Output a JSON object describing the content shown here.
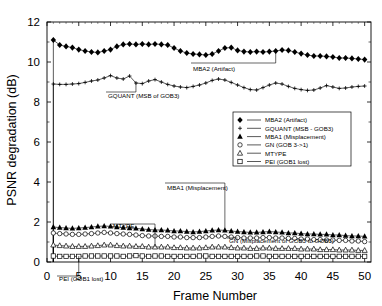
{
  "chart_data": {
    "type": "line",
    "title": "",
    "xlabel": "Frame Number",
    "ylabel": "PSNR degradation (dB)",
    "xlim": [
      0,
      51
    ],
    "ylim": [
      0,
      12
    ],
    "xticks": [
      0,
      5,
      10,
      15,
      20,
      25,
      30,
      35,
      40,
      45,
      50
    ],
    "yticks": [
      0,
      2,
      4,
      6,
      8,
      10,
      12
    ],
    "grid": false,
    "legend_position": "center-right",
    "x": [
      1,
      2,
      3,
      4,
      5,
      6,
      7,
      8,
      9,
      10,
      11,
      12,
      13,
      14,
      15,
      16,
      17,
      18,
      19,
      20,
      21,
      22,
      23,
      24,
      25,
      26,
      27,
      28,
      29,
      30,
      31,
      32,
      33,
      34,
      35,
      36,
      37,
      38,
      39,
      40,
      41,
      42,
      43,
      44,
      45,
      46,
      47,
      48,
      49,
      50
    ],
    "series": [
      {
        "name": "MBA2 (Artifact)",
        "marker": "filled-diamond",
        "color": "#000000",
        "values": [
          11.1,
          10.85,
          10.78,
          10.72,
          10.62,
          10.55,
          10.5,
          10.48,
          10.55,
          10.62,
          10.78,
          10.88,
          10.9,
          10.88,
          10.9,
          10.88,
          10.9,
          10.88,
          10.85,
          10.7,
          10.55,
          10.45,
          10.4,
          10.38,
          10.35,
          10.4,
          10.55,
          10.7,
          10.72,
          10.58,
          10.52,
          10.5,
          10.52,
          10.5,
          10.52,
          10.55,
          10.6,
          10.58,
          10.5,
          10.42,
          10.35,
          10.3,
          10.3,
          10.28,
          10.25,
          10.2,
          10.2,
          10.18,
          10.15,
          10.12
        ]
      },
      {
        "name": "GQUANT (MSB - GOB3)",
        "marker": "plus",
        "color": "#000000",
        "values": [
          8.9,
          8.88,
          8.88,
          8.9,
          8.92,
          8.98,
          9.05,
          9.1,
          9.2,
          9.32,
          9.2,
          9.15,
          9.3,
          8.95,
          8.92,
          9.05,
          9.12,
          9.0,
          8.88,
          8.8,
          8.75,
          8.72,
          8.78,
          8.85,
          8.95,
          9.08,
          9.15,
          9.1,
          8.98,
          8.85,
          8.72,
          8.62,
          8.6,
          8.72,
          8.85,
          8.95,
          8.9,
          8.78,
          8.68,
          8.62,
          8.58,
          8.6,
          8.7,
          8.82,
          8.75,
          8.68,
          8.7,
          8.75,
          8.78,
          8.8
        ]
      },
      {
        "name": "MBA1 (Misplacement)",
        "marker": "filled-triangle",
        "color": "#000000",
        "values": [
          1.75,
          1.72,
          1.7,
          1.68,
          1.7,
          1.72,
          1.75,
          1.78,
          1.8,
          1.78,
          1.75,
          1.72,
          1.7,
          1.68,
          1.65,
          1.62,
          1.6,
          1.6,
          1.58,
          1.55,
          1.55,
          1.52,
          1.5,
          1.52,
          1.55,
          1.58,
          1.6,
          1.58,
          1.55,
          1.52,
          1.5,
          1.48,
          1.48,
          1.5,
          1.52,
          1.5,
          1.48,
          1.45,
          1.45,
          1.42,
          1.4,
          1.4,
          1.38,
          1.38,
          1.35,
          1.35,
          1.32,
          1.3,
          1.3,
          1.28
        ]
      },
      {
        "name": "GN (GOB 3->1)",
        "marker": "open-circle",
        "color": "#000000",
        "values": [
          1.45,
          1.42,
          1.4,
          1.38,
          1.38,
          1.4,
          1.42,
          1.45,
          1.48,
          1.45,
          1.42,
          1.4,
          1.38,
          1.35,
          1.32,
          1.3,
          1.3,
          1.28,
          1.28,
          1.25,
          1.25,
          1.22,
          1.22,
          1.22,
          1.25,
          1.28,
          1.3,
          1.28,
          1.25,
          1.22,
          1.2,
          1.2,
          1.2,
          1.22,
          1.22,
          1.2,
          1.2,
          1.18,
          1.18,
          1.15,
          1.15,
          1.12,
          1.12,
          1.1,
          1.1,
          1.08,
          1.08,
          1.05,
          1.05,
          1.02
        ]
      },
      {
        "name": "MTYPE",
        "marker": "open-triangle",
        "color": "#000000",
        "values": [
          0.85,
          0.82,
          0.8,
          0.78,
          0.78,
          0.78,
          0.8,
          0.82,
          0.85,
          0.85,
          0.82,
          0.8,
          0.8,
          0.78,
          0.78,
          0.75,
          0.75,
          0.75,
          0.75,
          0.72,
          0.72,
          0.7,
          0.7,
          0.7,
          0.72,
          0.75,
          0.75,
          0.75,
          0.72,
          0.7,
          0.7,
          0.68,
          0.68,
          0.7,
          0.7,
          0.68,
          0.68,
          0.68,
          0.68,
          0.65,
          0.65,
          0.65,
          0.62,
          0.62,
          0.62,
          0.6,
          0.6,
          0.6,
          0.58,
          0.58
        ]
      },
      {
        "name": "PEI (GOB1 lost)",
        "marker": "open-square",
        "color": "#000000",
        "values": [
          0.3,
          0.28,
          0.28,
          0.28,
          0.28,
          0.3,
          0.3,
          0.3,
          0.3,
          0.3,
          0.3,
          0.28,
          0.3,
          0.32,
          0.3,
          0.28,
          0.3,
          0.3,
          0.28,
          0.28,
          0.28,
          0.28,
          0.28,
          0.3,
          0.3,
          0.28,
          0.28,
          0.28,
          0.28,
          0.28,
          0.28,
          0.28,
          0.3,
          0.3,
          0.28,
          0.28,
          0.28,
          0.28,
          0.28,
          0.28,
          0.28,
          0.28,
          0.28,
          0.28,
          0.28,
          0.28,
          0.28,
          0.28,
          0.28,
          0.28
        ]
      }
    ],
    "annotations": [
      {
        "text": "MBA2 (Artifact)",
        "id": "mba2"
      },
      {
        "text": "GQUANT (MSB of GOB3)",
        "id": "gquant"
      },
      {
        "text": "MBA1 (Misplacement)",
        "id": "mba1"
      },
      {
        "text": "GN (Misplacement of GOB3 to GOB1)",
        "id": "gn"
      },
      {
        "text": "MTYPE",
        "id": "mtype"
      },
      {
        "text": "PEI (GOB1 lost)",
        "id": "pei"
      }
    ]
  },
  "legend": {
    "entries": [
      {
        "label": "MBA2 (Artifact)",
        "marker": "filled-diamond"
      },
      {
        "label": "GQUANT (MSB - GOB3)",
        "marker": "plus"
      },
      {
        "label": "MBA1 (Misplacement)",
        "marker": "filled-triangle"
      },
      {
        "label": "GN (GOB 3->1)",
        "marker": "open-circle"
      },
      {
        "label": "MTYPE",
        "marker": "open-triangle"
      },
      {
        "label": "PEI (GOB1 lost)",
        "marker": "open-square"
      }
    ]
  },
  "axes": {
    "y_title": "PSNR degradation (dB)",
    "x_title": "Frame Number",
    "y_tick_labels": [
      "0",
      "2",
      "4",
      "6",
      "8",
      "10",
      "12"
    ],
    "x_tick_labels": [
      "0",
      "5",
      "10",
      "15",
      "20",
      "25",
      "30",
      "35",
      "40",
      "45",
      "50"
    ]
  }
}
